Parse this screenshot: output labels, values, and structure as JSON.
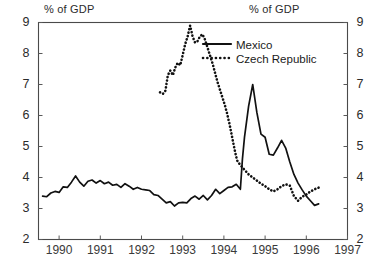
{
  "figure": {
    "unit_label_left": "% of GDP",
    "unit_label_right": "% of GDP"
  },
  "legend": {
    "entries": [
      {
        "label": "Mexico",
        "style": "solid",
        "color": "#111111"
      },
      {
        "label": "Czech Republic",
        "style": "dotted",
        "color": "#111111"
      }
    ]
  },
  "chart_data": {
    "type": "line",
    "title": "",
    "subtitle": "",
    "xlabel": "",
    "ylabel": "% of GDP",
    "ylabel_right": "% of GDP",
    "xlim": [
      1989.5,
      1997.0
    ],
    "ylim": [
      2,
      9
    ],
    "yticks": [
      2,
      3,
      4,
      5,
      6,
      7,
      8,
      9
    ],
    "ytick_labels": [
      "2",
      "3",
      "4",
      "5",
      "6",
      "7",
      "8",
      "9"
    ],
    "dual_y_axis": true,
    "xticks": [
      1990,
      1991,
      1992,
      1993,
      1994,
      1995,
      1996,
      1997
    ],
    "xtick_labels": [
      "1990",
      "1991",
      "1992",
      "1993",
      "1994",
      "1995",
      "1996",
      "1997"
    ],
    "grid": false,
    "legend_position": "upper-right-inside",
    "series": [
      {
        "name": "Mexico",
        "style": "solid",
        "color": "#111111",
        "x": [
          1989.6,
          1989.7,
          1989.8,
          1989.9,
          1990.0,
          1990.1,
          1990.2,
          1990.3,
          1990.4,
          1990.5,
          1990.6,
          1990.7,
          1990.8,
          1990.9,
          1991.0,
          1991.1,
          1991.2,
          1991.3,
          1991.4,
          1991.5,
          1991.6,
          1991.7,
          1991.8,
          1991.9,
          1992.0,
          1992.1,
          1992.2,
          1992.3,
          1992.4,
          1992.5,
          1992.6,
          1992.7,
          1992.8,
          1992.9,
          1993.0,
          1993.1,
          1993.2,
          1993.3,
          1993.4,
          1993.5,
          1993.6,
          1993.7,
          1993.8,
          1993.9,
          1994.0,
          1994.1,
          1994.2,
          1994.3,
          1994.4,
          1994.45,
          1994.5,
          1994.6,
          1994.7,
          1994.8,
          1994.9,
          1995.0,
          1995.1,
          1995.2,
          1995.3,
          1995.4,
          1995.5,
          1995.6,
          1995.7,
          1995.8,
          1995.9,
          1996.0,
          1996.1,
          1996.2,
          1996.3
        ],
        "y": [
          3.4,
          3.38,
          3.5,
          3.55,
          3.52,
          3.7,
          3.68,
          3.85,
          4.05,
          3.85,
          3.72,
          3.88,
          3.92,
          3.82,
          3.9,
          3.8,
          3.85,
          3.75,
          3.78,
          3.68,
          3.8,
          3.72,
          3.62,
          3.68,
          3.62,
          3.6,
          3.58,
          3.45,
          3.42,
          3.3,
          3.18,
          3.22,
          3.08,
          3.18,
          3.2,
          3.18,
          3.32,
          3.4,
          3.3,
          3.42,
          3.28,
          3.42,
          3.62,
          3.48,
          3.58,
          3.68,
          3.7,
          3.78,
          3.62,
          4.6,
          5.3,
          6.3,
          7.0,
          6.1,
          5.4,
          5.3,
          4.75,
          4.72,
          4.95,
          5.2,
          4.95,
          4.5,
          4.1,
          3.82,
          3.6,
          3.4,
          3.25,
          3.1,
          3.15
        ]
      },
      {
        "name": "Czech Republic",
        "style": "dotted",
        "color": "#111111",
        "x": [
          1992.45,
          1992.52,
          1992.58,
          1992.64,
          1992.7,
          1992.76,
          1992.82,
          1992.88,
          1992.94,
          1993.0,
          1993.06,
          1993.12,
          1993.18,
          1993.24,
          1993.3,
          1993.36,
          1993.42,
          1993.48,
          1993.54,
          1993.6,
          1993.66,
          1993.72,
          1993.78,
          1993.84,
          1993.9,
          1993.96,
          1994.02,
          1994.08,
          1994.14,
          1994.2,
          1994.26,
          1994.32,
          1994.4,
          1994.5,
          1994.6,
          1994.7,
          1994.8,
          1994.9,
          1995.0,
          1995.1,
          1995.2,
          1995.3,
          1995.4,
          1995.5,
          1995.6,
          1995.7,
          1995.8,
          1995.9,
          1996.0,
          1996.1,
          1996.2,
          1996.35
        ],
        "y": [
          6.75,
          6.7,
          6.8,
          7.3,
          7.45,
          7.3,
          7.55,
          7.7,
          7.62,
          7.95,
          8.3,
          8.55,
          8.9,
          8.55,
          8.35,
          8.4,
          8.55,
          8.62,
          8.45,
          8.2,
          7.95,
          7.7,
          7.4,
          7.1,
          6.85,
          6.6,
          6.35,
          6.05,
          5.7,
          5.3,
          4.9,
          4.55,
          4.4,
          4.25,
          4.1,
          4.0,
          3.9,
          3.8,
          3.72,
          3.62,
          3.55,
          3.62,
          3.72,
          3.78,
          3.74,
          3.4,
          3.25,
          3.38,
          3.45,
          3.55,
          3.62,
          3.7
        ]
      }
    ]
  }
}
